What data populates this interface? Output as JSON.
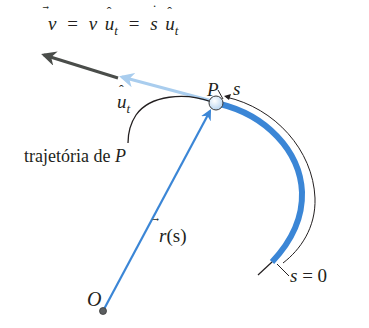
{
  "diagram": {
    "title_equation": {
      "v": "v",
      "eq1": "=",
      "v_scalar": "v",
      "u": "u",
      "sub_t1": "t",
      "eq2": "=",
      "s_dot": "s",
      "u2": "u",
      "sub_t2": "t"
    },
    "labels": {
      "unit_tangent": "u",
      "unit_tangent_sub": "t",
      "point_P": "P",
      "arc_s": "s",
      "trajectory_text": "trajetória de ",
      "trajectory_P": "P",
      "position_vector": "r",
      "position_arg": "(s)",
      "origin": "O",
      "s_zero_s": "s",
      "s_zero_rest": "= 0"
    },
    "colors": {
      "velocity_arrow": "#4a4d4a",
      "unit_tangent_arrow": "#a9cdee",
      "path_blue": "#3b86d6",
      "position_vector": "#3b86d6",
      "outline": "#231f20",
      "point_fill": "#dbe9f7"
    }
  }
}
